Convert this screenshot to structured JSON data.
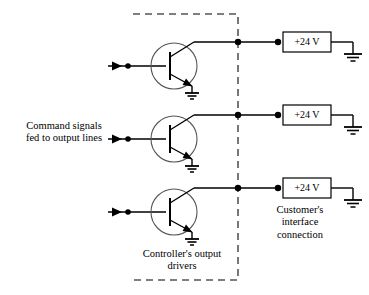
{
  "diagram": {
    "title_present": false,
    "type": "electrical-schematic",
    "colors": {
      "wire": "#000000",
      "boundary": "#555555",
      "background": "#ffffff",
      "text": "#000000"
    },
    "labels": {
      "command_signals": "Command signals\nfed to output lines",
      "controller_drivers": "Controller's output\ndrivers",
      "customer_interface": "Customer's\ninterface\nconnection"
    },
    "supply_boxes": [
      {
        "id": "supply-1",
        "value": "+24 V"
      },
      {
        "id": "supply-2",
        "value": "+24 V"
      },
      {
        "id": "supply-3",
        "value": "+24 V"
      }
    ],
    "channels": [
      {
        "id": "channel-1",
        "y": 42,
        "device": "npn-transistor",
        "emitter": "ground",
        "input": "command-signal"
      },
      {
        "id": "channel-2",
        "y": 115,
        "device": "npn-transistor",
        "emitter": "ground",
        "input": "command-signal"
      },
      {
        "id": "channel-3",
        "y": 188,
        "device": "npn-transistor",
        "emitter": "ground",
        "input": "command-signal"
      }
    ],
    "boundary": {
      "name": "controller-boundary",
      "style": "dashed",
      "edges": [
        "top",
        "right",
        "bottom"
      ]
    }
  }
}
